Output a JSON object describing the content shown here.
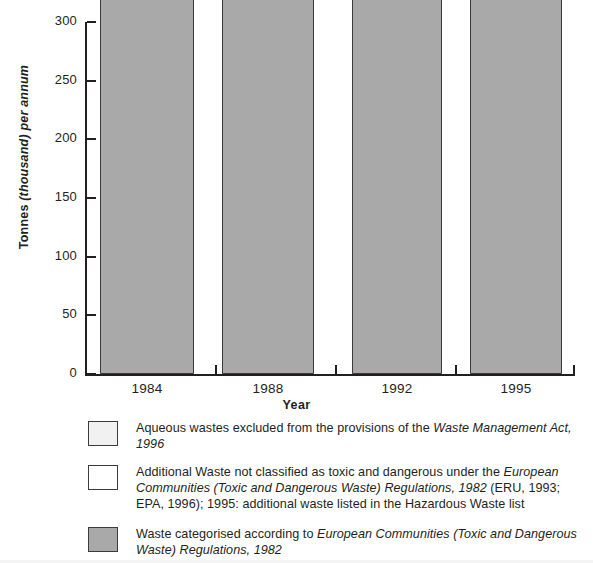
{
  "chart_data": {
    "type": "bar",
    "stacked": true,
    "title": "",
    "xlabel": "Year",
    "ylabel": "Tonnes (thousand) per annum",
    "ylabel_parts": {
      "plain": "Tonnes ",
      "italic": "(thousand) per annum"
    },
    "categories": [
      "1984",
      "1988",
      "1992",
      "1995"
    ],
    "ylim": [
      0,
      300
    ],
    "yticks": [
      0,
      50,
      100,
      150,
      200,
      250,
      300
    ],
    "ytick_labels": [
      "0",
      "50",
      "100",
      "150",
      "200",
      "250",
      "300"
    ],
    "grid": false,
    "units": "tonnes",
    "series": [
      {
        "name": "Waste categorised according to European Communities (Toxic and Dangerous Waste) Regulations, 1982",
        "key": "grey",
        "color": "#a9a9a9",
        "values": [
          52500,
          72850,
          99393,
          119456
        ],
        "labels": [
          "52,500",
          "72,850",
          "99,393",
          "119,456"
        ]
      },
      {
        "name": "Additional Waste not classified as toxic and dangerous under the European Communities (Toxic and Dangerous Waste) Regulations, 1982 (ERU, 1993; EPA, 1996); 1995: additional waste listed in the Hazardous Waste list",
        "key": "white",
        "color": "#ffffff",
        "values": [
          56000,
          56000,
          40200,
          65716
        ],
        "labels": [
          "56,000",
          "56,000",
          "40,200",
          "65,716"
        ]
      },
      {
        "name": "Aqueous wastes excluded from the provisions of the Waste Management Act, 1996",
        "key": "light",
        "color": "#f1f1f1",
        "values": [
          0,
          0,
          0,
          58582
        ],
        "labels": [
          "",
          "",
          "",
          "58,582"
        ]
      }
    ],
    "totals": [
      108500,
      128850,
      139593,
      243754
    ],
    "total_labels": [
      "108,500",
      "128,850",
      "139,593",
      "243,754"
    ],
    "legend_position": "below"
  },
  "legend": {
    "items": [
      {
        "swatch": "light",
        "line_1_plain": "Aqueous wastes excluded from the provisions of the ",
        "line_1_italic": "Waste Management Act, 1996"
      },
      {
        "swatch": "white",
        "line_1_plain": "Additional Waste not classified as toxic and dangerous under the ",
        "line_1_italic": "European Communities (Toxic and Dangerous Waste) Regulations, 1982",
        "line_2_plain": " (ERU, 1993; EPA, 1996); 1995: additional waste listed in the Hazardous Waste list"
      },
      {
        "swatch": "grey",
        "line_1_plain": "Waste categorised according to ",
        "line_1_italic": "European Communities (Toxic and Dangerous Waste) Regulations, 1982"
      }
    ]
  },
  "colors": {
    "grey_segment": "#a9a9a9",
    "white_segment": "#ffffff",
    "light_segment": "#f1f1f1",
    "axis": "#231f20",
    "background": "#ffffff"
  }
}
